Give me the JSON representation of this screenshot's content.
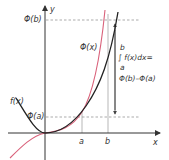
{
  "diagram": {
    "axes": {
      "x_label": "x",
      "y_label": "y"
    },
    "curves": {
      "f": {
        "label": "f(x)",
        "color": "#222222"
      },
      "phi": {
        "label": "Φ(x)",
        "color": "#d9617a"
      }
    },
    "levels": {
      "phi_b": "Φ(b)",
      "phi_a": "Φ(a)"
    },
    "ticks": {
      "a": "a",
      "b": "b"
    },
    "formula": {
      "upper": "b",
      "integral": "∫ f(x)dx=",
      "lower": "a",
      "result": "Φ(b)–Φ(a)"
    },
    "colors": {
      "axis": "#333333",
      "guide": "#888888",
      "black_curve": "#222222",
      "pink_curve": "#d9617a"
    }
  }
}
